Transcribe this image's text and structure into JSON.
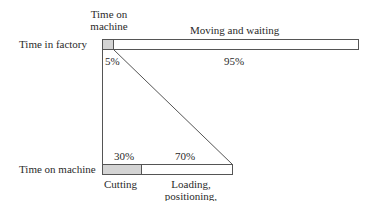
{
  "diagram": {
    "top_row": {
      "label": "Time in factory",
      "segments": [
        {
          "header": "Time on machine",
          "header_lines": [
            "Time on",
            "machine"
          ],
          "percent": "5%",
          "fill": "#d4d4d4"
        },
        {
          "header": "Moving and waiting",
          "percent": "95%",
          "fill": "#ffffff"
        }
      ]
    },
    "bottom_row": {
      "label": "Time on machine",
      "segments": [
        {
          "percent": "30%",
          "caption": "Cutting",
          "fill": "#d4d4d4"
        },
        {
          "percent": "70%",
          "caption_lines": [
            "Loading,",
            "positioning,",
            "gaging, etc."
          ],
          "fill": "#ffffff"
        }
      ]
    },
    "colors": {
      "stroke": "#555555",
      "gray_fill": "#d4d4d4"
    }
  }
}
